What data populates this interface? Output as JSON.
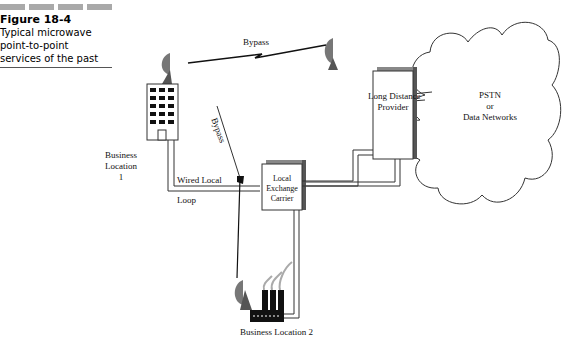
{
  "caption": {
    "figure_label": "Figure 18-4",
    "line1": "Typical microwave",
    "line2": "point-to-point",
    "line3": "services of the past"
  },
  "nodes": {
    "business_location_1": {
      "line1": "Business",
      "line2": "Location",
      "line3": "1"
    },
    "business_location_2": "Business Location 2",
    "long_distance_provider": {
      "line1": "Long Distance",
      "line2": "Provider"
    },
    "local_exchange_carrier": {
      "line1": "Local",
      "line2": "Exchange",
      "line3": "Carrier"
    },
    "cloud": {
      "line1": "PSTN",
      "line2": "or",
      "line3": "Data Networks"
    }
  },
  "links": {
    "bypass_top": "Bypass",
    "bypass_vertical": "Bypass",
    "wired_local": "Wired Local",
    "loop": "Loop"
  },
  "colors": {
    "line": "#222222",
    "dish": "#777777",
    "building": "#111111",
    "bars": "#a9a9a9"
  }
}
